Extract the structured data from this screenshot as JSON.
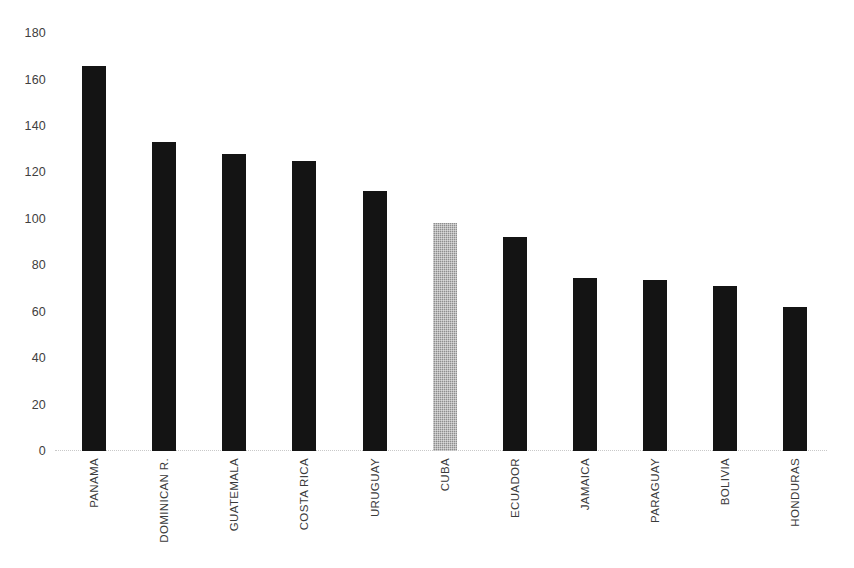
{
  "chart_data": {
    "type": "bar",
    "title": "",
    "subtitle": "",
    "xlabel": "",
    "ylabel": "",
    "categories": [
      "PANAMA",
      "DOMINICAN R.",
      "GUATEMALA",
      "COSTA RICA",
      "URUGUAY",
      "CUBA",
      "ECUADOR",
      "JAMAICA",
      "PARAGUAY",
      "BOLIVIA",
      "HONDURAS"
    ],
    "values": [
      166,
      133,
      128,
      125,
      112,
      98,
      92,
      74.5,
      73.5,
      71,
      62
    ],
    "ylim": [
      0,
      180
    ],
    "yticks": [
      0,
      20,
      40,
      60,
      80,
      100,
      120,
      140,
      160,
      180
    ],
    "ytick_labels": [
      "0",
      "20",
      "40",
      "60",
      "80",
      "100",
      "120",
      "140",
      "160",
      "180"
    ],
    "grid": false,
    "legend": null,
    "legend_position": "none",
    "annotations": [],
    "highlight_category": "CUBA",
    "bar_color": "#141414",
    "highlight_bar_color": "#8e8e8e",
    "axis_line_color": "#c9c9c9",
    "tick_label_color": "#404040",
    "category_label_color": "#3a3a3a",
    "background_color": "#ffffff",
    "category_label_rotation": -90
  }
}
